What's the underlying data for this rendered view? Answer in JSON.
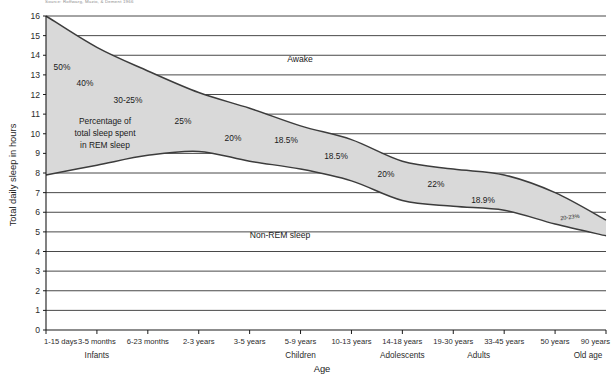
{
  "source_note": "Source: Roffwarg, Muzio, & Dement 1966",
  "chart_data": {
    "type": "area",
    "title": "",
    "xlabel": "Age",
    "ylabel": "Total daily sleep in hours",
    "ylim": [
      0,
      16
    ],
    "ytick_labels": [
      "0",
      "1",
      "2",
      "3",
      "4",
      "5",
      "6",
      "7",
      "8",
      "9",
      "10",
      "11",
      "12",
      "13",
      "14",
      "15",
      "16"
    ],
    "grid": true,
    "legend_position": "inline-annotations",
    "categories": [
      "1-15 days",
      "3-5 months",
      "6-23 months",
      "2-3 years",
      "3-5 years",
      "5-9 years",
      "10-13 years",
      "14-18 years",
      "19-30 years",
      "33-45 years",
      "50 years",
      "90 years"
    ],
    "group_labels": [
      {
        "label": "Infants",
        "start": "1-15 days",
        "end": "6-23 months"
      },
      {
        "label": "Children",
        "start": "3-5 years",
        "end": "10-13 years"
      },
      {
        "label": "Adolescents",
        "start": "14-18 years",
        "end": "14-18 years"
      },
      {
        "label": "Adults",
        "start": "19-30 years",
        "end": "33-45 years"
      },
      {
        "label": "Old age",
        "start": "90 years",
        "end": "90 years"
      }
    ],
    "series": [
      {
        "name": "Total sleep (REM + Non-REM)",
        "values": [
          16.0,
          14.4,
          13.2,
          12.1,
          11.3,
          10.4,
          9.7,
          8.6,
          8.2,
          7.9,
          7.0,
          5.6
        ]
      },
      {
        "name": "Non-REM sleep",
        "values": [
          7.9,
          8.4,
          8.9,
          9.1,
          8.6,
          8.2,
          7.6,
          6.6,
          6.3,
          6.1,
          5.4,
          4.8
        ]
      }
    ],
    "band_labels": [
      {
        "text": "Awake",
        "note": "region above total sleep curve"
      },
      {
        "text": "Non-REM sleep",
        "note": "region below REM/Non-REM boundary"
      }
    ],
    "rem_caption": [
      "Percentage of",
      "total sleep spent",
      "in REM sleep"
    ],
    "rem_percent_annotations": [
      {
        "text": "50%",
        "x": 62,
        "y": 70
      },
      {
        "text": "40%",
        "x": 85,
        "y": 86
      },
      {
        "text": "30-25%",
        "x": 128,
        "y": 103
      },
      {
        "text": "25%",
        "x": 183,
        "y": 124
      },
      {
        "text": "20%",
        "x": 233,
        "y": 141
      },
      {
        "text": "18.5%",
        "x": 286,
        "y": 143
      },
      {
        "text": "18.5%",
        "x": 336,
        "y": 159
      },
      {
        "text": "20%",
        "x": 386,
        "y": 177
      },
      {
        "text": "22%",
        "x": 436,
        "y": 187
      },
      {
        "text": "18.9%",
        "x": 483,
        "y": 203
      },
      {
        "text": "20-23%",
        "x": 570,
        "y": 219
      }
    ],
    "colors": {
      "band_fill": "#d9d9d9",
      "curve": "#3c3c3c",
      "grid": "#1a1a1a",
      "axis": "#1a1a1a",
      "text": "#1a1a1a"
    }
  }
}
